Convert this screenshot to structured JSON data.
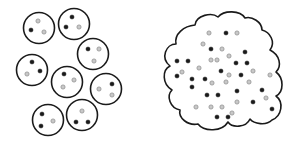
{
  "diagram": {
    "colors": {
      "outline": "#1a1a1a",
      "dark_dot": "#1a1a1a",
      "light_dot_fill": "#c8c8c8",
      "light_dot_stroke": "#8a8a8a",
      "background": "#ffffff"
    },
    "dot_radius": 2.1,
    "circle_radius": 15.5,
    "separate_circles": [
      {
        "cx": 39,
        "cy": 28,
        "dots": [
          {
            "x": 38,
            "y": 21,
            "t": "light"
          },
          {
            "x": 31,
            "y": 30,
            "t": "dark"
          },
          {
            "x": 44,
            "y": 32,
            "t": "light"
          }
        ]
      },
      {
        "cx": 74,
        "cy": 24,
        "dots": [
          {
            "x": 72,
            "y": 17,
            "t": "dark"
          },
          {
            "x": 66,
            "y": 27,
            "t": "dark"
          },
          {
            "x": 79,
            "y": 27,
            "t": "light"
          }
        ]
      },
      {
        "cx": 93,
        "cy": 54,
        "dots": [
          {
            "x": 88,
            "y": 49,
            "t": "dark"
          },
          {
            "x": 99,
            "y": 49,
            "t": "light"
          },
          {
            "x": 94,
            "y": 61,
            "t": "light"
          }
        ]
      },
      {
        "cx": 32,
        "cy": 70,
        "dots": [
          {
            "x": 32,
            "y": 62,
            "t": "dark"
          },
          {
            "x": 40,
            "y": 71,
            "t": "dark"
          },
          {
            "x": 27,
            "y": 74,
            "t": "light"
          }
        ]
      },
      {
        "cx": 67,
        "cy": 82,
        "dots": [
          {
            "x": 64,
            "y": 74,
            "t": "dark"
          },
          {
            "x": 74,
            "y": 80,
            "t": "light"
          },
          {
            "x": 63,
            "y": 87,
            "t": "light"
          }
        ]
      },
      {
        "cx": 106,
        "cy": 89,
        "dots": [
          {
            "x": 112,
            "y": 84,
            "t": "dark"
          },
          {
            "x": 99,
            "y": 89,
            "t": "light"
          },
          {
            "x": 112,
            "y": 95,
            "t": "light"
          }
        ]
      },
      {
        "cx": 48,
        "cy": 120,
        "dots": [
          {
            "x": 42,
            "y": 114,
            "t": "dark"
          },
          {
            "x": 53,
            "y": 121,
            "t": "light"
          },
          {
            "x": 41,
            "y": 126,
            "t": "dark"
          }
        ]
      },
      {
        "cx": 82,
        "cy": 115,
        "dots": [
          {
            "x": 82,
            "y": 111,
            "t": "light"
          },
          {
            "x": 76,
            "y": 122,
            "t": "dark"
          },
          {
            "x": 88,
            "y": 122,
            "t": "dark"
          }
        ]
      }
    ],
    "cluster": {
      "path": "M 195 25 C 196 15, 212 12, 218 17 C 224 10, 240 10, 245 18 C 252 16, 262 22, 262 30 C 270 32, 276 42, 270 50 C 280 55, 282 66, 276 72 C 284 78, 284 92, 276 96 C 284 102, 282 116, 272 120 C 266 126, 254 124, 250 119 C 246 128, 232 128, 228 122 C 222 132, 204 132, 198 124 C 188 126, 178 118, 180 110 C 170 108, 166 96, 172 90 C 162 84, 162 70, 170 66 C 160 58, 166 44, 176 44 C 174 34, 184 26, 195 25 Z",
      "dots": [
        {
          "x": 209,
          "y": 33,
          "t": "light"
        },
        {
          "x": 226,
          "y": 33,
          "t": "dark"
        },
        {
          "x": 237,
          "y": 33,
          "t": "light"
        },
        {
          "x": 203,
          "y": 44,
          "t": "light"
        },
        {
          "x": 211,
          "y": 49,
          "t": "dark"
        },
        {
          "x": 222,
          "y": 49,
          "t": "light"
        },
        {
          "x": 245,
          "y": 52,
          "t": "dark"
        },
        {
          "x": 229,
          "y": 56,
          "t": "light"
        },
        {
          "x": 177,
          "y": 61,
          "t": "dark"
        },
        {
          "x": 188,
          "y": 61,
          "t": "dark"
        },
        {
          "x": 211,
          "y": 60,
          "t": "light"
        },
        {
          "x": 217,
          "y": 60,
          "t": "light"
        },
        {
          "x": 236,
          "y": 63,
          "t": "dark"
        },
        {
          "x": 247,
          "y": 63,
          "t": "dark"
        },
        {
          "x": 199,
          "y": 68,
          "t": "light"
        },
        {
          "x": 182,
          "y": 72,
          "t": "light"
        },
        {
          "x": 177,
          "y": 76,
          "t": "dark"
        },
        {
          "x": 221,
          "y": 71,
          "t": "dark"
        },
        {
          "x": 229,
          "y": 75,
          "t": "light"
        },
        {
          "x": 241,
          "y": 75,
          "t": "dark"
        },
        {
          "x": 253,
          "y": 71,
          "t": "light"
        },
        {
          "x": 270,
          "y": 75,
          "t": "light"
        },
        {
          "x": 192,
          "y": 79,
          "t": "dark"
        },
        {
          "x": 205,
          "y": 79,
          "t": "dark"
        },
        {
          "x": 212,
          "y": 83,
          "t": "light"
        },
        {
          "x": 226,
          "y": 82,
          "t": "light"
        },
        {
          "x": 249,
          "y": 82,
          "t": "light"
        },
        {
          "x": 192,
          "y": 87,
          "t": "dark"
        },
        {
          "x": 237,
          "y": 91,
          "t": "dark"
        },
        {
          "x": 262,
          "y": 90,
          "t": "dark"
        },
        {
          "x": 207,
          "y": 95,
          "t": "dark"
        },
        {
          "x": 218,
          "y": 95,
          "t": "dark"
        },
        {
          "x": 266,
          "y": 98,
          "t": "light"
        },
        {
          "x": 196,
          "y": 107,
          "t": "light"
        },
        {
          "x": 211,
          "y": 107,
          "t": "light"
        },
        {
          "x": 222,
          "y": 107,
          "t": "light"
        },
        {
          "x": 237,
          "y": 102,
          "t": "light"
        },
        {
          "x": 253,
          "y": 102,
          "t": "dark"
        },
        {
          "x": 272,
          "y": 109,
          "t": "dark"
        },
        {
          "x": 232,
          "y": 113,
          "t": "light"
        },
        {
          "x": 217,
          "y": 117,
          "t": "dark"
        },
        {
          "x": 228,
          "y": 117,
          "t": "dark"
        }
      ]
    }
  }
}
